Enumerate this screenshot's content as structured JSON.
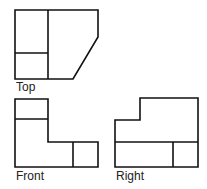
{
  "diagram": {
    "stroke_color": "#111111",
    "views": [
      {
        "id": "top",
        "label": "Top"
      },
      {
        "id": "front",
        "label": "Front"
      },
      {
        "id": "right",
        "label": "Right"
      }
    ]
  }
}
